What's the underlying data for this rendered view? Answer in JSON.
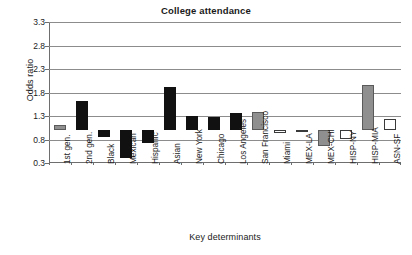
{
  "chart_data": {
    "type": "bar",
    "title": "College attendance",
    "xlabel": "Key determinants",
    "ylabel": "Odds ratio",
    "ylim": [
      0.3,
      3.3
    ],
    "yticks": [
      0.3,
      0.8,
      1.3,
      1.8,
      2.3,
      2.8,
      3.3
    ],
    "ytick_labels": [
      "0.3",
      "0.8",
      "1.3",
      "1.8",
      "2.3",
      "2.8",
      "3.3"
    ],
    "baseline": 1.0,
    "grid": true,
    "legend": "none",
    "categories": [
      "1st gen.",
      "2nd gen.",
      "Black",
      "Mexican",
      "Hispanic",
      "Asian",
      "New York",
      "Chicago",
      "Los Angeles",
      "San Francisco",
      "Miami",
      "MEX-LA",
      "MEX-CHI",
      "HISP-NY",
      "HISP-MIA",
      "ASN-SF"
    ],
    "values": [
      1.1,
      1.61,
      0.86,
      0.4,
      0.72,
      1.92,
      1.31,
      1.28,
      1.37,
      1.39,
      0.93,
      0.95,
      0.66,
      0.81,
      1.97,
      1.24
    ],
    "bar_fills": [
      "gray",
      "black",
      "black",
      "black",
      "black",
      "black",
      "black",
      "black",
      "black",
      "gray",
      "white",
      "white",
      "gray",
      "white",
      "gray",
      "white"
    ],
    "colors": {
      "black": "#111111",
      "gray": "#8f8f8f",
      "white": "#ffffff",
      "outline": "#3a3a3a",
      "gridline": "#8c8c8c",
      "axis": "#6e6e6e"
    }
  }
}
